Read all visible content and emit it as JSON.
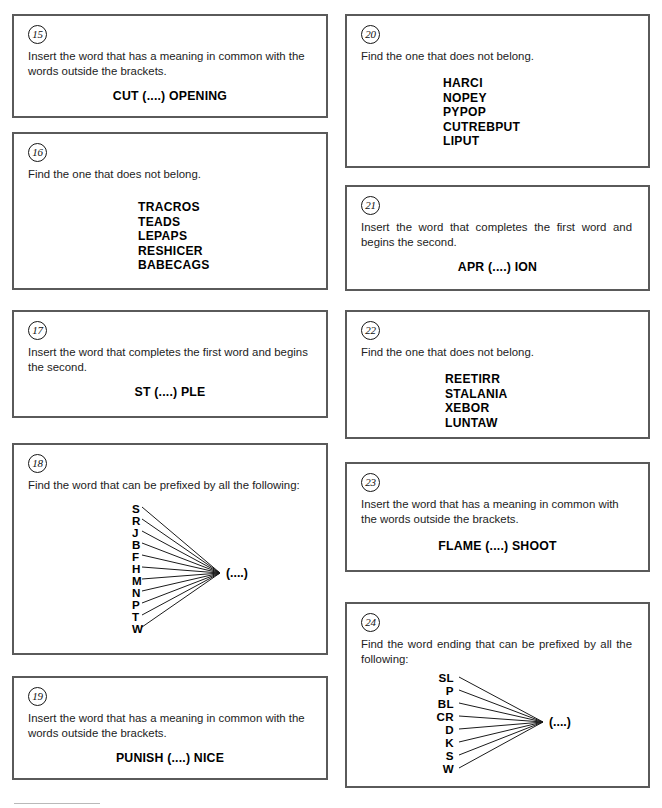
{
  "page": {
    "puzzles": [
      {
        "number": "15",
        "prompt": "Insert the word that has a meaning in common with the words outside the brackets.",
        "answer_line": "CUT (....) OPENING",
        "type": "brackets"
      },
      {
        "number": "16",
        "prompt": "Find the one that does not belong.",
        "words": [
          "TRACROS",
          "TEADS",
          "LEPAPS",
          "RESHICER",
          "BABECAGS"
        ],
        "type": "word-list"
      },
      {
        "number": "17",
        "prompt": "Insert the word that completes the first word and begins the second.",
        "answer_line": "ST (....) PLE",
        "type": "brackets"
      },
      {
        "number": "18",
        "prompt": "Find the word that can be prefixed by all the following:",
        "fan_labels": [
          "S",
          "R",
          "J",
          "B",
          "F",
          "H",
          "M",
          "N",
          "P",
          "T",
          "W"
        ],
        "fan_target": "(....)",
        "type": "fan"
      },
      {
        "number": "19",
        "prompt": "Insert the word that has a meaning in common with the words outside the brackets.",
        "answer_line": "PUNISH (....) NICE",
        "type": "brackets"
      },
      {
        "number": "20",
        "prompt": "Find the one that does not belong.",
        "words": [
          "HARCI",
          "NOPEY",
          "PYPOP",
          "CUTREBPUT",
          "LIPUT"
        ],
        "type": "word-list"
      },
      {
        "number": "21",
        "prompt": "Insert the word that completes the first word and begins the second.",
        "answer_line": "APR (....) ION",
        "type": "brackets"
      },
      {
        "number": "22",
        "prompt": "Find the one that does not belong.",
        "words": [
          "REETIRR",
          "STALANIA",
          "XEBOR",
          "LUNTAW"
        ],
        "type": "word-list"
      },
      {
        "number": "23",
        "prompt": "Insert the word that has a meaning in common with the words outside the brackets.",
        "answer_line": "FLAME (....) SHOOT",
        "type": "brackets"
      },
      {
        "number": "24",
        "prompt": "Find the word ending that can be prefixed by all the following:",
        "fan_labels": [
          "SL",
          "P",
          "BL",
          "CR",
          "D",
          "K",
          "S",
          "W"
        ],
        "fan_target": "(....)",
        "type": "fan"
      }
    ]
  },
  "style": {
    "border_color": "#5a5a5a",
    "text_color": "#222222",
    "bold_text_color": "#000000",
    "background": "#ffffff"
  }
}
